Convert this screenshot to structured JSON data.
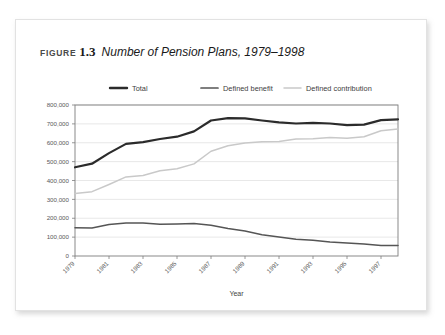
{
  "caption": {
    "figure_word": "Figure",
    "number": "1.3",
    "title": "Number of Pension Plans, 1979–1998"
  },
  "chart_data": {
    "type": "line",
    "title": "Number of Pension Plans, 1979–1998",
    "xlabel": "Year",
    "ylabel": "",
    "x": [
      1979,
      1980,
      1981,
      1982,
      1983,
      1984,
      1985,
      1986,
      1987,
      1988,
      1989,
      1990,
      1991,
      1992,
      1993,
      1994,
      1995,
      1996,
      1997,
      1998
    ],
    "xlim": [
      1979,
      1998
    ],
    "ylim": [
      0,
      800000
    ],
    "yticks": [
      0,
      100000,
      200000,
      300000,
      400000,
      500000,
      600000,
      700000,
      800000
    ],
    "ytick_labels": [
      "0",
      "100,000",
      "200,000",
      "300,000",
      "400,000",
      "500,000",
      "600,000",
      "700,000",
      "800,000"
    ],
    "xticks": [
      1979,
      1981,
      1983,
      1985,
      1987,
      1989,
      1991,
      1993,
      1995,
      1997
    ],
    "xtick_labels": [
      "1979",
      "1981",
      "1983",
      "1985",
      "1987",
      "1989",
      "1991",
      "1993",
      "1995",
      "1997"
    ],
    "grid": true,
    "grid_axis": "y",
    "legend_position": "top",
    "series": [
      {
        "name": "Total",
        "color": "#2b2b2b",
        "width": 2.2,
        "values": [
          470000,
          489000,
          545000,
          594000,
          603000,
          620000,
          632000,
          660000,
          718000,
          730000,
          729000,
          718000,
          708000,
          702000,
          705000,
          702000,
          693000,
          696000,
          720000,
          724000
        ]
      },
      {
        "name": "Defined benefit",
        "color": "#555555",
        "width": 1.5,
        "values": [
          150000,
          148000,
          167000,
          175000,
          175000,
          168000,
          170000,
          172000,
          163000,
          146000,
          132000,
          113000,
          101000,
          89000,
          84000,
          74000,
          69000,
          64000,
          56000,
          56000
        ]
      },
      {
        "name": "Defined contribution",
        "color": "#c9c9c9",
        "width": 1.5,
        "values": [
          331000,
          341000,
          379000,
          419000,
          427000,
          452000,
          462000,
          488000,
          555000,
          584000,
          599000,
          605000,
          607000,
          620000,
          621000,
          628000,
          624000,
          632000,
          664000,
          673000
        ]
      }
    ]
  },
  "legend": {
    "items": [
      {
        "label": "Total",
        "color": "#2b2b2b",
        "width": 2.4
      },
      {
        "label": "Defined benefit",
        "color": "#555555",
        "width": 1.7
      },
      {
        "label": "Defined contribution",
        "color": "#c9c9c9",
        "width": 1.5
      }
    ]
  },
  "colors": {
    "card_background": "#ffffff",
    "frame": "#7d7d7d",
    "gridline": "#d9d9d9",
    "text": "#3c3c3c"
  }
}
